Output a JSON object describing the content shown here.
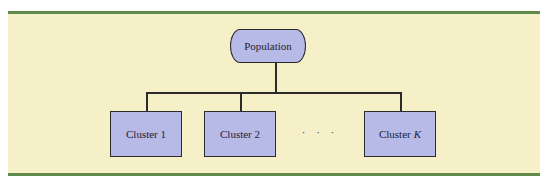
{
  "diagram": {
    "root": {
      "label": "Population"
    },
    "clusters": [
      {
        "label": "Cluster 1"
      },
      {
        "label": "Cluster 2"
      },
      {
        "label": "Cluster",
        "suffix": "K"
      }
    ],
    "ellipsis": "· · ·"
  },
  "colors": {
    "panel_background": "#f5f0c8",
    "rule": "#5f8a4a",
    "node_fill": "#b7b9e6",
    "stroke": "#2b2b2b"
  }
}
